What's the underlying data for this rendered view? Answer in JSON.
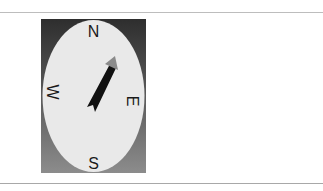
{
  "compass": {
    "labels": {
      "north": "N",
      "east": "E",
      "south": "S",
      "west": "W"
    },
    "colors": {
      "bg_top": "#2e2e2e",
      "bg_bottom": "#8c8c8c",
      "face": "#e9e9e9",
      "needle": "#111111",
      "needle_head": "#8a8a8a",
      "text": "#1a1a1a"
    }
  }
}
